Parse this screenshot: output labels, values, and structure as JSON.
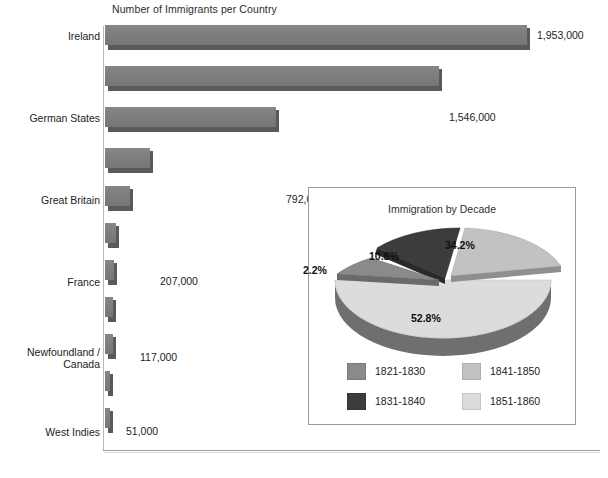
{
  "chart_data": [
    {
      "type": "bar",
      "orientation": "horizontal",
      "title": "Number of Immigrants per Country",
      "xlabel": "",
      "ylabel": "",
      "xlim": [
        0,
        1953000
      ],
      "grid": false,
      "categories": [
        "Ireland",
        "German States",
        "Great Britain",
        "France",
        "Newfoundland /\nCanada",
        "West Indies",
        "China",
        "Switzerland",
        "Sweden / Norway",
        "Netherlands",
        "Mexico"
      ],
      "values": [
        1953000,
        1546000,
        792000,
        207000,
        117000,
        51000,
        41000,
        38000,
        36000,
        21000,
        18000
      ],
      "value_labels": [
        "1,953,000",
        "1,546,000",
        "792,000",
        "207,000",
        "117,000",
        "51,000",
        "41,000",
        "38,000",
        "36,000",
        "21,000",
        "18,000"
      ],
      "bar_color": "#7d7d7d",
      "bar_shadow_color": "#5a5a5a"
    },
    {
      "type": "pie",
      "title": "Immigration by Decade",
      "labels": [
        "1821-1830",
        "1831-1840",
        "1841-1850",
        "1851-1860"
      ],
      "values": [
        2.2,
        10.8,
        34.2,
        52.8
      ],
      "value_labels": [
        "2.2%",
        "10.8%",
        "34.2%",
        "52.8%"
      ],
      "colors": [
        "#8a8a8a",
        "#3c3c3c",
        "#c2c2c2",
        "#dcdcdc"
      ],
      "legend_position": "bottom",
      "exploded": [
        "1821-1830",
        "1831-1840",
        "1841-1850"
      ]
    }
  ],
  "bar_chart": {
    "title": "Number of Immigrants per Country",
    "rows": [
      {
        "label": "Ireland",
        "value_label": "1,953,000",
        "value": 1953000
      },
      {
        "label": "German States",
        "value_label": "1,546,000",
        "value": 1546000
      },
      {
        "label": "Great Britain",
        "value_label": "792,000",
        "value": 792000
      },
      {
        "label": "France",
        "value_label": "207,000",
        "value": 207000
      },
      {
        "label": "Newfoundland /\nCanada",
        "value_label": "117,000",
        "value": 117000
      },
      {
        "label": "West Indies",
        "value_label": "51,000",
        "value": 51000
      },
      {
        "label": "China",
        "value_label": "41,000",
        "value": 41000
      },
      {
        "label": "Switzerland",
        "value_label": "38,000",
        "value": 38000
      },
      {
        "label": "Sweden / Norway",
        "value_label": "36,000",
        "value": 36000
      },
      {
        "label": "Netherlands",
        "value_label": "21,000",
        "value": 21000
      },
      {
        "label": "Mexico",
        "value_label": "18,000",
        "value": 18000
      }
    ]
  },
  "pie_chart": {
    "title": "Immigration by Decade",
    "slices": [
      {
        "pct_label": "2.2%",
        "value": 2.2,
        "decade": "1821-1830",
        "color": "#8a8a8a"
      },
      {
        "pct_label": "10.8%",
        "value": 10.8,
        "decade": "1831-1840",
        "color": "#3c3c3c"
      },
      {
        "pct_label": "34.2%",
        "value": 34.2,
        "decade": "1841-1850",
        "color": "#c2c2c2"
      },
      {
        "pct_label": "52.8%",
        "value": 52.8,
        "decade": "1851-1860",
        "color": "#dcdcdc"
      }
    ],
    "legend": [
      {
        "label": "1821-1830",
        "color": "#8a8a8a"
      },
      {
        "label": "1841-1850",
        "color": "#c2c2c2"
      },
      {
        "label": "1831-1840",
        "color": "#3c3c3c"
      },
      {
        "label": "1851-1860",
        "color": "#dcdcdc"
      }
    ]
  },
  "footnote": ""
}
